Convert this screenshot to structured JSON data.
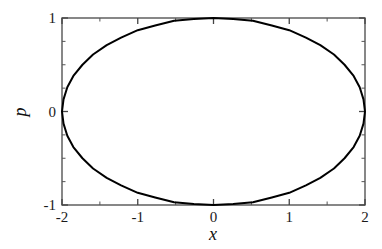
{
  "chart_data": {
    "type": "line",
    "title": "",
    "subtitle": "",
    "xlabel": "x",
    "ylabel": "p",
    "xlim": [
      -2,
      2
    ],
    "ylim": [
      -1,
      1
    ],
    "xticks": [
      -2,
      -1,
      0,
      1,
      2
    ],
    "yticks": [
      -1,
      0,
      1
    ],
    "xtick_labels": [
      "-2",
      "-1",
      "0",
      "1",
      "2"
    ],
    "ytick_labels": [
      "-1",
      "0",
      "1"
    ],
    "x_minor_tick_step": 0.5,
    "y_minor_tick_step": 0.25,
    "grid": false,
    "legend": null,
    "legend_position": "none",
    "frame": "box",
    "tick_direction": "in",
    "series": [
      {
        "name": "phase-space-trajectory",
        "color": "#000000",
        "linewidth": 2,
        "closed": true,
        "description": "ellipse x = 2 cos(t), p = sin(t)",
        "x": [
          2.0,
          1.98,
          1.93,
          1.85,
          1.73,
          1.59,
          1.41,
          1.22,
          1.0,
          0.77,
          0.52,
          0.26,
          0.0,
          -0.26,
          -0.52,
          -0.77,
          -1.0,
          -1.22,
          -1.41,
          -1.59,
          -1.73,
          -1.85,
          -1.93,
          -1.98,
          -2.0,
          -1.98,
          -1.93,
          -1.85,
          -1.73,
          -1.59,
          -1.41,
          -1.22,
          -1.0,
          -0.77,
          -0.52,
          -0.26,
          0.0,
          0.26,
          0.52,
          0.77,
          1.0,
          1.22,
          1.41,
          1.59,
          1.73,
          1.85,
          1.93,
          1.98,
          2.0
        ],
        "y": [
          0.0,
          0.13,
          0.26,
          0.38,
          0.5,
          0.61,
          0.71,
          0.79,
          0.87,
          0.92,
          0.97,
          0.99,
          1.0,
          0.99,
          0.97,
          0.92,
          0.87,
          0.79,
          0.71,
          0.61,
          0.5,
          0.38,
          0.26,
          0.13,
          0.0,
          -0.13,
          -0.26,
          -0.38,
          -0.5,
          -0.61,
          -0.71,
          -0.79,
          -0.87,
          -0.92,
          -0.97,
          -0.99,
          -1.0,
          -0.99,
          -0.97,
          -0.92,
          -0.87,
          -0.79,
          -0.71,
          -0.61,
          -0.5,
          -0.38,
          -0.26,
          -0.13,
          0.0
        ]
      }
    ],
    "annotations": [],
    "colors": {
      "background": "#ffffff",
      "axis": "#4a4a4a",
      "curve": "#000000",
      "text": "#111111"
    }
  }
}
